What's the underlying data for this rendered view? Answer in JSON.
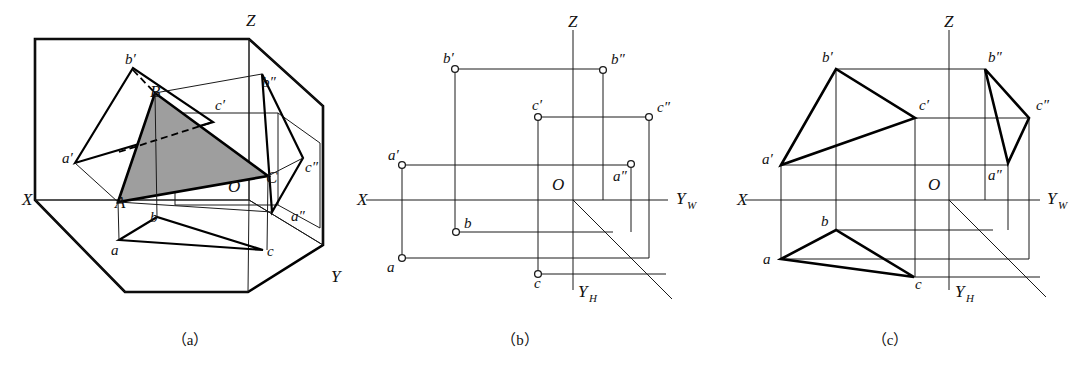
{
  "figure": {
    "type": "descriptive-geometry-orthographic-projection",
    "panels": [
      {
        "id": "a",
        "caption": "（a）",
        "caption_x": 190,
        "caption_y": 345,
        "description": "Pictorial view: triangle ABC inside the three-projection-plane box with its H, V and W projections",
        "axes": [
          {
            "name": "X",
            "label": "X",
            "x": 22,
            "y": 205
          },
          {
            "name": "Y",
            "label": "Y",
            "x": 331,
            "y": 282
          },
          {
            "name": "Z",
            "label": "Z",
            "x": 246,
            "y": 26
          }
        ],
        "origin": {
          "label": "O",
          "x": 228,
          "y": 192
        },
        "points": [
          {
            "label": "A",
            "x": 115,
            "y": 208
          },
          {
            "label": "B",
            "x": 150,
            "y": 97
          },
          {
            "label": "C",
            "x": 266,
            "y": 183
          },
          {
            "label": "a′",
            "x": 62,
            "y": 163
          },
          {
            "label": "b′",
            "x": 125,
            "y": 64
          },
          {
            "label": "c′",
            "x": 215,
            "y": 110
          },
          {
            "label": "a″",
            "x": 291,
            "y": 221
          },
          {
            "label": "b″",
            "x": 262,
            "y": 87
          },
          {
            "label": "c″",
            "x": 305,
            "y": 172
          },
          {
            "label": "a",
            "x": 111,
            "y": 255
          },
          {
            "label": "b",
            "x": 150,
            "y": 222
          },
          {
            "label": "c",
            "x": 267,
            "y": 256
          }
        ]
      },
      {
        "id": "b",
        "caption": "（b）",
        "caption_x": 520,
        "caption_y": 345,
        "description": "Three-view layout showing only the projected points a,b,c / a′,b′,c′ / a″,b″,c″ with projection connection lines",
        "axes": [
          {
            "name": "X",
            "label": "X",
            "x": 357,
            "y": 205
          },
          {
            "name": "Z",
            "label": "Z",
            "x": 568,
            "y": 27
          },
          {
            "name": "YW",
            "label": "Y",
            "sub": "W",
            "x": 676,
            "y": 204
          },
          {
            "name": "YH",
            "label": "Y",
            "sub": "H",
            "x": 578,
            "y": 297
          }
        ],
        "origin": {
          "label": "O",
          "x": 552,
          "y": 190
        },
        "points": [
          {
            "label": "a′",
            "x": 388,
            "y": 160,
            "px": 402,
            "py": 165
          },
          {
            "label": "b′",
            "x": 443,
            "y": 63,
            "px": 455,
            "py": 69
          },
          {
            "label": "c′",
            "x": 532,
            "y": 110,
            "px": 538,
            "py": 117
          },
          {
            "label": "a″",
            "x": 613,
            "y": 181,
            "px": 631,
            "py": 164
          },
          {
            "label": "b″",
            "x": 611,
            "y": 64,
            "px": 603,
            "py": 70
          },
          {
            "label": "c″",
            "x": 657,
            "y": 112,
            "px": 649,
            "py": 117
          },
          {
            "label": "a",
            "x": 387,
            "y": 272,
            "px": 402,
            "py": 258
          },
          {
            "label": "b",
            "x": 464,
            "y": 228,
            "px": 456,
            "py": 232
          },
          {
            "label": "c",
            "x": 534,
            "y": 288,
            "px": 538,
            "py": 274
          }
        ]
      },
      {
        "id": "c",
        "caption": "（c）",
        "caption_x": 890,
        "caption_y": 345,
        "description": "Completed three views: the three projections of triangle ABC drawn in as closed triangles",
        "axes": [
          {
            "name": "X",
            "label": "X",
            "x": 737,
            "y": 205
          },
          {
            "name": "Z",
            "label": "Z",
            "x": 944,
            "y": 27
          },
          {
            "name": "YW",
            "label": "Y",
            "sub": "W",
            "x": 1047,
            "y": 204
          },
          {
            "name": "YH",
            "label": "Y",
            "sub": "H",
            "x": 949,
            "y": 297
          }
        ],
        "origin": {
          "label": "O",
          "x": 928,
          "y": 190
        },
        "points": [
          {
            "label": "a′",
            "x": 762,
            "y": 164,
            "px": 781,
            "py": 165
          },
          {
            "label": "b′",
            "x": 822,
            "y": 62,
            "px": 836,
            "py": 69
          },
          {
            "label": "c′",
            "x": 919,
            "y": 110,
            "px": 915,
            "py": 118
          },
          {
            "label": "a″",
            "x": 988,
            "y": 180,
            "px": 1008,
            "py": 162
          },
          {
            "label": "b″",
            "x": 988,
            "y": 62,
            "px": 985,
            "py": 69
          },
          {
            "label": "c″",
            "x": 1036,
            "y": 110,
            "px": 1029,
            "py": 117
          },
          {
            "label": "a",
            "x": 763,
            "y": 264,
            "px": 781,
            "py": 259
          },
          {
            "label": "b",
            "x": 821,
            "y": 226,
            "px": 836,
            "py": 230
          },
          {
            "label": "c",
            "x": 915,
            "y": 289,
            "px": 914,
            "py": 277
          }
        ]
      }
    ],
    "colors": {
      "line": "#111111",
      "shade": "#9e9e9e",
      "background": "#ffffff"
    }
  }
}
